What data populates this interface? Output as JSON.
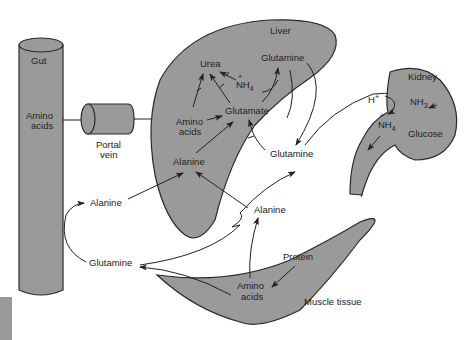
{
  "diagram": {
    "type": "metabolic-flow",
    "colors": {
      "organ_fill": "#9a9a9a",
      "outline": "#2a2a2a",
      "background": "#ffffff"
    },
    "organs": {
      "gut": {
        "label": "Gut",
        "content": [
          "Amino",
          "acids"
        ]
      },
      "portal_vein": {
        "label": [
          "Portal",
          "vein"
        ]
      },
      "liver": {
        "label": "Liver",
        "urea": "Urea",
        "nh4": "NH",
        "nh4_sub": "4",
        "nh4_sup": "+",
        "glutamine": "Glutamine",
        "amino_acids": [
          "Amino",
          "acids"
        ],
        "glutamate": "Glutamate",
        "alanine": "Alanine"
      },
      "kidney": {
        "label": "Kidney",
        "h_plus": "H",
        "h_sup": "+",
        "nh3": "NH",
        "nh3_sub": "3",
        "nh4": "NH",
        "nh4_sub": "4",
        "nh4_sup": "+",
        "glucose": "Glucose"
      },
      "muscle": {
        "label": "Muscle tissue",
        "protein": "Protein",
        "amino_acids": [
          "Amino",
          "acids"
        ]
      }
    },
    "free_labels": {
      "glutamine_mid": "Glutamine",
      "alanine_mid": "Alanine",
      "alanine_left": "Alanine",
      "glutamine_left": "Glutamine"
    }
  }
}
